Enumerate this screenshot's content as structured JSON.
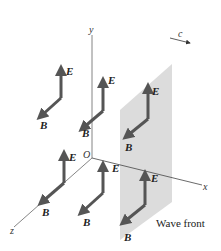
{
  "diagram": {
    "axes": {
      "x": "x",
      "y": "y",
      "z": "z",
      "origin": "O"
    },
    "propagation_label": "c",
    "wavefront_label": "Wave front",
    "field_labels": {
      "electric": "E",
      "magnetic": "B"
    },
    "colors": {
      "vector": "#555555",
      "plane": "#dcdcdc",
      "axis": "#666666"
    },
    "vector_pairs": [
      {
        "id": "upper-left"
      },
      {
        "id": "upper-middle"
      },
      {
        "id": "upper-right-on-wavefront"
      },
      {
        "id": "lower-left"
      },
      {
        "id": "lower-middle"
      },
      {
        "id": "lower-right-on-wavefront"
      }
    ]
  }
}
